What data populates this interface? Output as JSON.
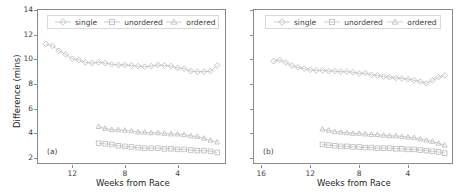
{
  "figure": {
    "background": "#ffffff",
    "line_color": "#b9b9b9",
    "marker_color": "#b9b9b9",
    "axis_color": "#8a8a8a",
    "text_color": "#3f3f3f"
  },
  "chart_data": [
    {
      "type": "line",
      "panel_tag": "(a)",
      "title": "",
      "xlabel": "Weeks from Race",
      "ylabel": "Difference (mins)",
      "xlim": [
        14.6,
        0.4
      ],
      "ylim": [
        1.6,
        14.0
      ],
      "x_inverted": true,
      "xticks": [
        12,
        8,
        4
      ],
      "yticks": [
        2,
        4,
        6,
        8,
        10,
        12,
        14
      ],
      "grid": false,
      "legend_position": "upper center",
      "series": [
        {
          "name": "single",
          "marker": "diamond",
          "x": [
            14.0,
            13.5,
            13.0,
            12.5,
            12.0,
            11.5,
            11.0,
            10.5,
            10.0,
            9.5,
            9.0,
            8.5,
            8.0,
            7.5,
            7.0,
            6.5,
            6.0,
            5.5,
            5.0,
            4.5,
            4.0,
            3.5,
            3.0,
            2.5,
            2.0,
            1.5,
            1.0
          ],
          "y": [
            11.25,
            11.1,
            10.7,
            10.4,
            10.05,
            9.95,
            9.75,
            9.7,
            9.75,
            9.7,
            9.6,
            9.55,
            9.55,
            9.5,
            9.45,
            9.4,
            9.45,
            9.55,
            9.5,
            9.45,
            9.3,
            9.25,
            9.05,
            9.0,
            9.0,
            9.05,
            9.5
          ]
        },
        {
          "name": "ordered",
          "marker": "triangle",
          "x": [
            10.0,
            9.5,
            9.0,
            8.5,
            8.0,
            7.5,
            7.0,
            6.5,
            6.0,
            5.5,
            5.0,
            4.5,
            4.0,
            3.5,
            3.0,
            2.5,
            2.0,
            1.5,
            1.0
          ],
          "y": [
            4.55,
            4.4,
            4.3,
            4.3,
            4.25,
            4.2,
            4.1,
            4.1,
            4.05,
            4.05,
            4.0,
            3.95,
            3.95,
            3.9,
            3.8,
            3.75,
            3.6,
            3.45,
            3.3
          ]
        },
        {
          "name": "unordered",
          "marker": "square",
          "x": [
            10.0,
            9.5,
            9.0,
            8.5,
            8.0,
            7.5,
            7.0,
            6.5,
            6.0,
            5.5,
            5.0,
            4.5,
            4.0,
            3.5,
            3.0,
            2.5,
            2.0,
            1.5,
            1.0
          ],
          "y": [
            3.2,
            3.15,
            3.1,
            3.0,
            2.95,
            2.9,
            2.85,
            2.8,
            2.8,
            2.8,
            2.75,
            2.75,
            2.7,
            2.7,
            2.65,
            2.6,
            2.6,
            2.55,
            2.45
          ]
        }
      ]
    },
    {
      "type": "line",
      "panel_tag": "(b)",
      "title": "",
      "xlabel": "Weeks from Race",
      "ylabel": "",
      "xlim": [
        16.6,
        0.4
      ],
      "ylim": [
        1.6,
        14.0
      ],
      "x_inverted": true,
      "xticks": [
        16,
        12,
        8,
        4
      ],
      "yticks": [
        2,
        4,
        6,
        8,
        10,
        12,
        14
      ],
      "grid": false,
      "legend_position": "upper center",
      "series": [
        {
          "name": "single",
          "marker": "diamond",
          "x": [
            15.0,
            14.5,
            14.0,
            13.5,
            13.0,
            12.5,
            12.0,
            11.5,
            11.0,
            10.5,
            10.0,
            9.5,
            9.0,
            8.5,
            8.0,
            7.5,
            7.0,
            6.5,
            6.0,
            5.5,
            5.0,
            4.5,
            4.0,
            3.5,
            3.0,
            2.5,
            2.0,
            1.5,
            1.0
          ],
          "y": [
            9.85,
            9.95,
            9.75,
            9.5,
            9.35,
            9.25,
            9.15,
            9.1,
            9.1,
            9.05,
            9.05,
            9.0,
            9.0,
            8.95,
            8.85,
            8.9,
            8.75,
            8.7,
            8.6,
            8.55,
            8.5,
            8.45,
            8.4,
            8.3,
            8.2,
            8.05,
            8.3,
            8.55,
            8.7
          ]
        },
        {
          "name": "ordered",
          "marker": "triangle",
          "x": [
            11.0,
            10.5,
            10.0,
            9.5,
            9.0,
            8.5,
            8.0,
            7.5,
            7.0,
            6.5,
            6.0,
            5.5,
            5.0,
            4.5,
            4.0,
            3.5,
            3.0,
            2.5,
            2.0,
            1.5,
            1.0
          ],
          "y": [
            4.35,
            4.25,
            4.15,
            4.1,
            4.05,
            4.0,
            4.0,
            3.95,
            3.9,
            3.9,
            3.85,
            3.8,
            3.8,
            3.75,
            3.7,
            3.65,
            3.55,
            3.45,
            3.35,
            3.2,
            3.05
          ]
        },
        {
          "name": "unordered",
          "marker": "square",
          "x": [
            11.0,
            10.5,
            10.0,
            9.5,
            9.0,
            8.5,
            8.0,
            7.5,
            7.0,
            6.5,
            6.0,
            5.5,
            5.0,
            4.5,
            4.0,
            3.5,
            3.0,
            2.5,
            2.0,
            1.5,
            1.0
          ],
          "y": [
            3.1,
            3.05,
            3.0,
            2.95,
            2.95,
            2.9,
            2.9,
            2.85,
            2.85,
            2.8,
            2.8,
            2.8,
            2.75,
            2.75,
            2.7,
            2.7,
            2.65,
            2.6,
            2.55,
            2.5,
            2.4
          ]
        }
      ]
    }
  ],
  "panel_a": {
    "tag": "(a)",
    "ylabel": "Difference (mins)",
    "xlabel": "Weeks from Race",
    "xticklabels": [
      "12",
      "8",
      "4"
    ],
    "yticklabels": [
      "2",
      "4",
      "6",
      "8",
      "10",
      "12",
      "14"
    ],
    "legend": [
      {
        "label": "single",
        "marker": "diamond"
      },
      {
        "label": "unordered",
        "marker": "square"
      },
      {
        "label": "ordered",
        "marker": "triangle"
      }
    ]
  },
  "panel_b": {
    "tag": "(b)",
    "ylabel": "",
    "xlabel": "Weeks from Race",
    "xticklabels": [
      "16",
      "12",
      "8",
      "4"
    ],
    "yticklabels": [
      "",
      "",
      "",
      "",
      "",
      "",
      ""
    ],
    "legend": [
      {
        "label": "single",
        "marker": "diamond"
      },
      {
        "label": "unordered",
        "marker": "square"
      },
      {
        "label": "ordered",
        "marker": "triangle"
      }
    ]
  }
}
